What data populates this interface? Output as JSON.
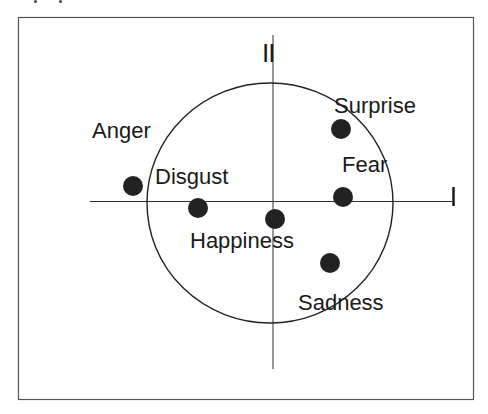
{
  "figure": {
    "axes": {
      "horizontal_label": "I",
      "vertical_label": "II"
    },
    "points": [
      {
        "label": "Anger",
        "x": 133,
        "y": 186
      },
      {
        "label": "Disgust",
        "x": 198,
        "y": 208
      },
      {
        "label": "Happiness",
        "x": 275,
        "y": 219
      },
      {
        "label": "Surprise",
        "x": 341,
        "y": 129
      },
      {
        "label": "Fear",
        "x": 343,
        "y": 197
      },
      {
        "label": "Sadness",
        "x": 330,
        "y": 263
      }
    ],
    "circle": {
      "cx": 270,
      "cy": 203,
      "rx": 123,
      "ry": 120
    },
    "colors": {
      "ink": "#1a1a1a",
      "frame": "#555555",
      "dot": "#222222"
    }
  }
}
